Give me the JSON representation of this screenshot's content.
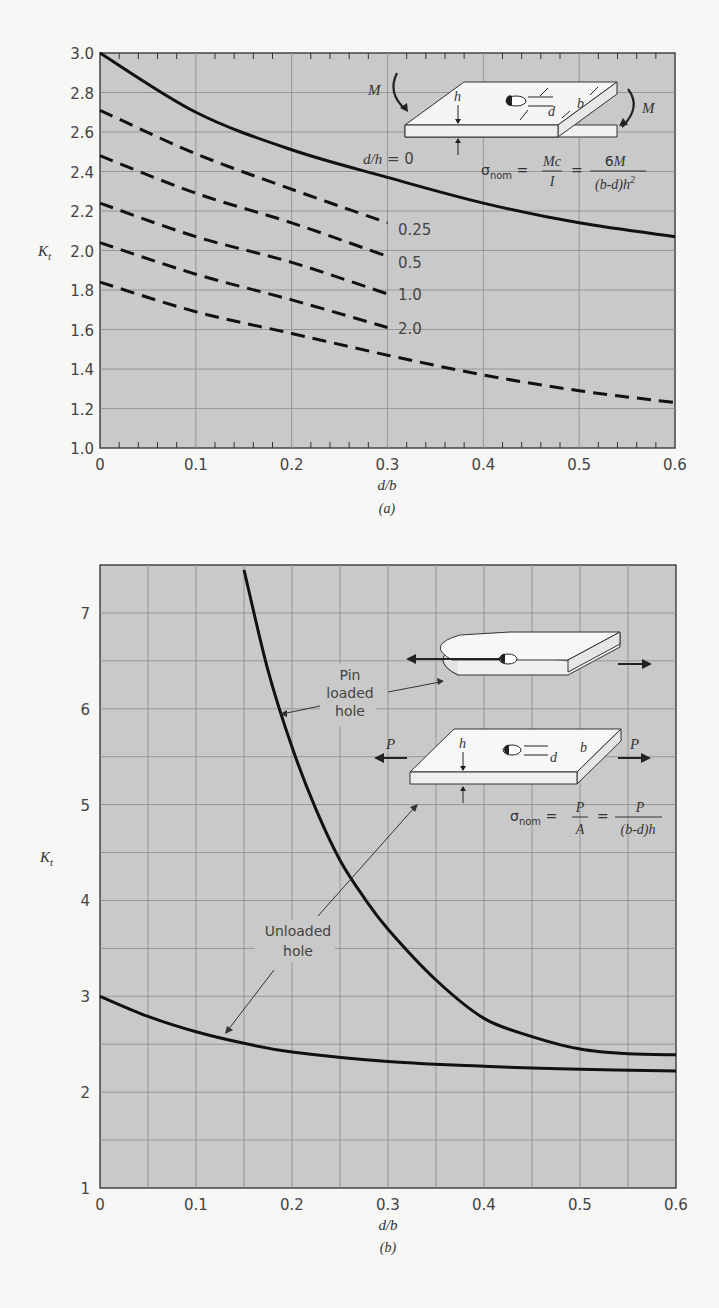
{
  "chart_data": [
    {
      "id": "a",
      "type": "line",
      "title": "",
      "caption": "(a)",
      "xlabel": "d/b",
      "ylabel": "K_t",
      "xlim": [
        0,
        0.6
      ],
      "ylim": [
        1.0,
        3.0
      ],
      "xticks": [
        "0",
        "0.1",
        "0.2",
        "0.3",
        "0.4",
        "0.5",
        "0.6"
      ],
      "yticks": [
        "1.0",
        "1.2",
        "1.4",
        "1.6",
        "1.8",
        "2.0",
        "2.2",
        "2.4",
        "2.6",
        "2.8",
        "3.0"
      ],
      "grid": true,
      "series": [
        {
          "name": "d/h = 0",
          "style": "solid",
          "x": [
            0,
            0.1,
            0.2,
            0.3,
            0.4,
            0.5,
            0.6
          ],
          "values": [
            3.0,
            2.7,
            2.51,
            2.37,
            2.24,
            2.14,
            2.07
          ]
        },
        {
          "name": "0.25",
          "style": "dashed",
          "x": [
            0,
            0.1,
            0.2,
            0.3
          ],
          "values": [
            2.71,
            2.49,
            2.31,
            2.14
          ]
        },
        {
          "name": "0.5",
          "style": "dashed",
          "x": [
            0,
            0.1,
            0.2,
            0.3
          ],
          "values": [
            2.48,
            2.29,
            2.14,
            1.97
          ]
        },
        {
          "name": "1.0",
          "style": "dashed",
          "x": [
            0,
            0.1,
            0.2,
            0.3
          ],
          "values": [
            2.24,
            2.07,
            1.94,
            1.78
          ]
        },
        {
          "name": "2.0",
          "style": "dashed",
          "x": [
            0,
            0.1,
            0.2,
            0.3
          ],
          "values": [
            2.04,
            1.88,
            1.75,
            1.61
          ]
        },
        {
          "name": "",
          "style": "dashed",
          "x": [
            0,
            0.1,
            0.2,
            0.3,
            0.4,
            0.5,
            0.6
          ],
          "values": [
            1.84,
            1.69,
            1.58,
            1.47,
            1.37,
            1.29,
            1.23
          ]
        }
      ],
      "annotations": {
        "curve_label_prefix": "d/h = 0",
        "moment_label": "M",
        "dim_h": "h",
        "dim_d": "d",
        "dim_b": "b",
        "formula": {
          "sigma": "σ",
          "sub": "nom",
          "eq": "=",
          "num1": "Mc",
          "den1": "I",
          "num2": "6M",
          "den2": "(b-d)h",
          "den2_sup": "2"
        }
      }
    },
    {
      "id": "b",
      "type": "line",
      "title": "",
      "caption": "(b)",
      "xlabel": "d/b",
      "ylabel": "K_t",
      "xlim": [
        0,
        0.6
      ],
      "ylim": [
        1,
        7.5
      ],
      "xticks": [
        "0",
        "0.1",
        "0.2",
        "0.3",
        "0.4",
        "0.5",
        "0.6"
      ],
      "yticks": [
        "1",
        "2",
        "3",
        "4",
        "5",
        "6",
        "7"
      ],
      "grid": true,
      "series": [
        {
          "name": "Pin loaded hole",
          "style": "solid",
          "x": [
            0.15,
            0.175,
            0.2,
            0.225,
            0.25,
            0.275,
            0.3,
            0.35,
            0.4,
            0.45,
            0.5,
            0.55,
            0.6
          ],
          "values": [
            7.45,
            6.4,
            5.6,
            4.95,
            4.42,
            4.03,
            3.7,
            3.17,
            2.77,
            2.58,
            2.45,
            2.4,
            2.39
          ]
        },
        {
          "name": "Unloaded hole",
          "style": "solid",
          "x": [
            0,
            0.05,
            0.1,
            0.15,
            0.2,
            0.3,
            0.4,
            0.5,
            0.6
          ],
          "values": [
            3.0,
            2.79,
            2.63,
            2.51,
            2.42,
            2.32,
            2.27,
            2.24,
            2.22
          ]
        }
      ],
      "annotations": {
        "pin_label": [
          "Pin",
          "loaded",
          "hole"
        ],
        "unloaded_label": [
          "Unloaded",
          "hole"
        ],
        "force_label": "P",
        "dim_h": "h",
        "dim_d": "d",
        "dim_b": "b",
        "formula": {
          "sigma": "σ",
          "sub": "nom",
          "eq": "=",
          "num1": "P",
          "den1": "A",
          "num2": "P",
          "den2": "(b-d)h"
        }
      }
    }
  ],
  "colors": {
    "page_bg": "#f7f7f5",
    "plot_bg": "#c9c9c9",
    "grid": "#8a8a8a",
    "curve": "#111111",
    "plate_fill": "#f2f2f2"
  }
}
